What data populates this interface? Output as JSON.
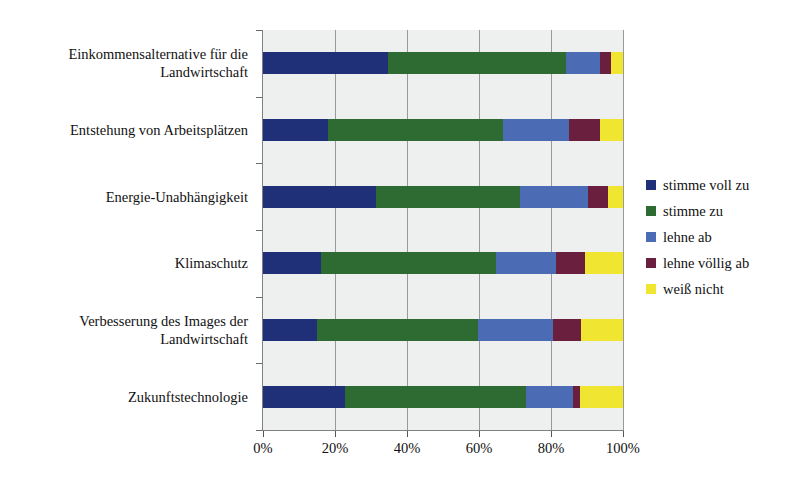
{
  "chart_data": {
    "type": "bar",
    "subtype": "100% stacked horizontal bar",
    "title": "",
    "title_remnant": "",
    "xlabel": "",
    "ylabel": "",
    "xlim": [
      0,
      100
    ],
    "x_tick_labels": [
      "0%",
      "20%",
      "40%",
      "60%",
      "80%",
      "100%"
    ],
    "x_tick_values": [
      0,
      20,
      40,
      60,
      80,
      100
    ],
    "grid": true,
    "legend_position": "right",
    "categories": [
      "Einkommensalternative für die Landwirtschaft",
      "Entstehung von Arbeitsplätzen",
      "Energie-Unabhängigkeit",
      "Klimaschutz",
      "Verbesserung des Images der Landwirtschaft",
      "Zukunftstechnologie"
    ],
    "category_lines": [
      [
        "Einkommensalternative für die",
        "Landwirtschaft"
      ],
      [
        "Entstehung von Arbeitsplätzen"
      ],
      [
        "Energie-Unabhängigkeit"
      ],
      [
        "Klimaschutz"
      ],
      [
        "Verbesserung des Images der",
        "Landwirtschaft"
      ],
      [
        "Zukunftstechnologie"
      ]
    ],
    "series": [
      {
        "name": "stimme voll zu",
        "color": "#1F3078",
        "values": [
          34.7,
          18.0,
          31.3,
          16.0,
          15.1,
          22.7
        ]
      },
      {
        "name": "stimme zu",
        "color": "#2E6B33",
        "values": [
          49.5,
          48.7,
          40.0,
          48.8,
          44.6,
          50.4
        ]
      },
      {
        "name": "lehne ab",
        "color": "#4C6BB5",
        "values": [
          9.5,
          18.3,
          19.0,
          16.7,
          20.9,
          13.0
        ]
      },
      {
        "name": "lehne völlig ab",
        "color": "#6B1F3F",
        "values": [
          3.0,
          8.5,
          5.5,
          7.9,
          7.8,
          1.9
        ]
      },
      {
        "name": "weiß nicht",
        "color": "#F0E632",
        "values": [
          3.3,
          6.5,
          4.2,
          10.6,
          11.6,
          12.0
        ]
      }
    ]
  },
  "legend": {
    "items": [
      {
        "label": "stimme voll zu",
        "color": "#1F3078"
      },
      {
        "label": "stimme zu",
        "color": "#2E6B33"
      },
      {
        "label": "lehne ab",
        "color": "#4C6BB5"
      },
      {
        "label": "lehne völlig ab",
        "color": "#6B1F3F"
      },
      {
        "label": "weiß nicht",
        "color": "#F0E632"
      }
    ]
  },
  "style": {
    "plot_background": "#eef0f0",
    "gridline_color": "#9a9a9a",
    "axis_color": "#808080",
    "text_color": "#111111"
  }
}
